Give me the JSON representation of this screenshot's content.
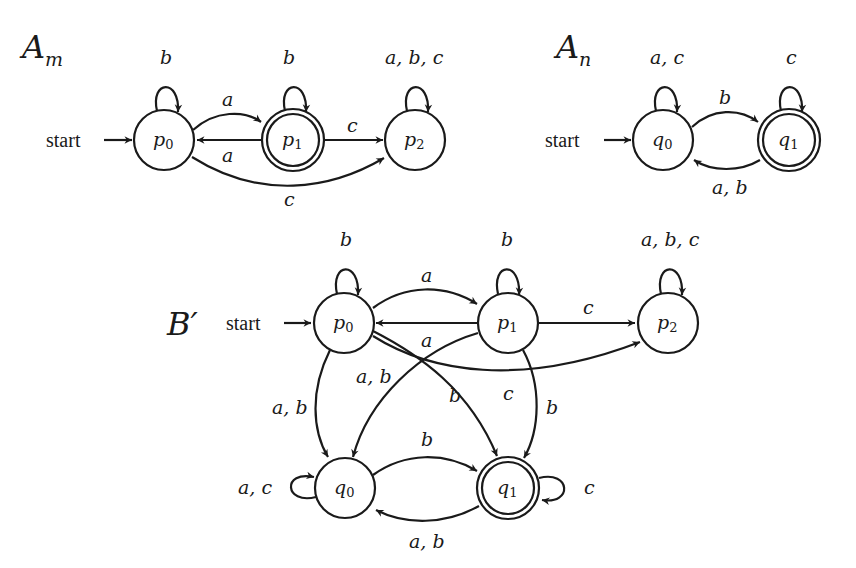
{
  "automata": [
    {
      "id": "A_m",
      "title": {
        "main": "A",
        "sub": "m"
      },
      "start_label": "start",
      "states": [
        {
          "name": "p",
          "index": "0",
          "accepting": false,
          "start": true
        },
        {
          "name": "p",
          "index": "1",
          "accepting": true,
          "start": false
        },
        {
          "name": "p",
          "index": "2",
          "accepting": false,
          "start": false
        }
      ],
      "transitions": [
        {
          "from": "p0",
          "to": "p0",
          "label": "b"
        },
        {
          "from": "p1",
          "to": "p1",
          "label": "b"
        },
        {
          "from": "p2",
          "to": "p2",
          "label": "a, b, c"
        },
        {
          "from": "p0",
          "to": "p1",
          "label": "a"
        },
        {
          "from": "p1",
          "to": "p0",
          "label": "a"
        },
        {
          "from": "p1",
          "to": "p2",
          "label": "c"
        },
        {
          "from": "p0",
          "to": "p2",
          "label": "c"
        }
      ]
    },
    {
      "id": "A_n",
      "title": {
        "main": "A",
        "sub": "n"
      },
      "start_label": "start",
      "states": [
        {
          "name": "q",
          "index": "0",
          "accepting": false,
          "start": true
        },
        {
          "name": "q",
          "index": "1",
          "accepting": true,
          "start": false
        }
      ],
      "transitions": [
        {
          "from": "q0",
          "to": "q0",
          "label": "a, c"
        },
        {
          "from": "q1",
          "to": "q1",
          "label": "c"
        },
        {
          "from": "q0",
          "to": "q1",
          "label": "b"
        },
        {
          "from": "q1",
          "to": "q0",
          "label": "a, b"
        }
      ]
    },
    {
      "id": "B_prime",
      "title": {
        "main": "B′",
        "sub": ""
      },
      "start_label": "start",
      "states": [
        {
          "name": "p",
          "index": "0",
          "accepting": false,
          "start": true
        },
        {
          "name": "p",
          "index": "1",
          "accepting": false,
          "start": false
        },
        {
          "name": "p",
          "index": "2",
          "accepting": false,
          "start": false
        },
        {
          "name": "q",
          "index": "0",
          "accepting": false,
          "start": false
        },
        {
          "name": "q",
          "index": "1",
          "accepting": true,
          "start": false
        }
      ],
      "transitions": [
        {
          "from": "p0",
          "to": "p0",
          "label": "b"
        },
        {
          "from": "p1",
          "to": "p1",
          "label": "b"
        },
        {
          "from": "p2",
          "to": "p2",
          "label": "a, b, c"
        },
        {
          "from": "p0",
          "to": "p1",
          "label": "a"
        },
        {
          "from": "p1",
          "to": "p0",
          "label": "a"
        },
        {
          "from": "p1",
          "to": "p2",
          "label": "c"
        },
        {
          "from": "p0",
          "to": "p2",
          "label": "c"
        },
        {
          "from": "p0",
          "to": "q0",
          "label": "a, b"
        },
        {
          "from": "p1",
          "to": "q0",
          "label": "a, b"
        },
        {
          "from": "p0",
          "to": "q1",
          "label": "b"
        },
        {
          "from": "p1",
          "to": "q1",
          "label": "b"
        },
        {
          "from": "q0",
          "to": "q1",
          "label": "b"
        },
        {
          "from": "q1",
          "to": "q0",
          "label": "a, b"
        },
        {
          "from": "q0",
          "to": "q0",
          "label": "a, c"
        },
        {
          "from": "q1",
          "to": "q1",
          "label": "c"
        }
      ]
    }
  ]
}
